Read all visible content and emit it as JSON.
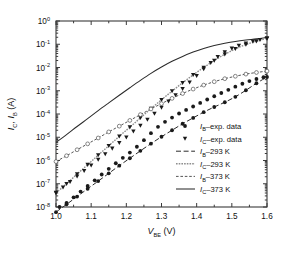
{
  "chart_data": {
    "type": "line",
    "title": "",
    "xlabel": "V_BE (V)",
    "xlabel_main": "V",
    "xlabel_sub": "BE",
    "xlabel_unit": " (V)",
    "ylabel": "I_C, I_B (A)",
    "ylabel_parts": [
      "I",
      "C",
      ", I",
      "B",
      " (A)"
    ],
    "xlim": [
      1.0,
      1.6
    ],
    "ylim_log": [
      -8,
      0
    ],
    "xticks": [
      "1.0",
      "1.1",
      "1.2",
      "1.3",
      "1.4",
      "1.5",
      "1.6"
    ],
    "xtick_values": [
      1.0,
      1.1,
      1.2,
      1.3,
      1.4,
      1.5,
      1.6
    ],
    "yticks": [
      "10^0",
      "10^-1",
      "10^-2",
      "10^-3",
      "10^-4",
      "10^-5",
      "10^-6",
      "10^-7",
      "10^-8"
    ],
    "ytick_exponents": [
      "0",
      "-1",
      "-2",
      "-3",
      "-4",
      "-5",
      "-6",
      "-7",
      "-8"
    ],
    "ytick_values": [
      1,
      0.1,
      0.01,
      0.001,
      0.0001,
      1e-05,
      1e-06,
      1e-07,
      1e-08
    ],
    "grid": false,
    "legend_position": "lower-right-inside",
    "series": [
      {
        "name": "I_C-373 K",
        "label_main": "I",
        "label_sub": "C",
        "label_rest": "–373 K",
        "style": "solid",
        "color": "#2b2b2b",
        "marker": "none",
        "x": [
          1.0,
          1.03,
          1.06,
          1.09,
          1.12,
          1.15,
          1.18,
          1.21,
          1.24,
          1.27,
          1.3,
          1.33,
          1.36,
          1.39,
          1.42,
          1.45,
          1.48,
          1.51,
          1.54,
          1.57,
          1.6
        ],
        "y": [
          6e-06,
          1.3e-05,
          2.9e-05,
          6.3e-05,
          0.00014,
          0.0003,
          0.00064,
          0.00135,
          0.0028,
          0.0056,
          0.0105,
          0.0185,
          0.03,
          0.046,
          0.066,
          0.088,
          0.11,
          0.132,
          0.152,
          0.17,
          0.195
        ]
      },
      {
        "name": "I_C-293 K",
        "label_main": "I",
        "label_sub": "C",
        "label_rest": "–293 K",
        "style": "dotted-gray",
        "color": "#8e8e8e",
        "marker": "triangle-down",
        "x": [
          1.0,
          1.03,
          1.06,
          1.09,
          1.12,
          1.15,
          1.18,
          1.21,
          1.24,
          1.27,
          1.3,
          1.33,
          1.36,
          1.39,
          1.42,
          1.45,
          1.48,
          1.51,
          1.54,
          1.57,
          1.6
        ],
        "y": [
          4e-08,
          1e-07,
          2.6e-07,
          6.6e-07,
          1.7e-06,
          4.3e-06,
          1.1e-05,
          2.7e-05,
          6.8e-05,
          0.00017,
          0.00041,
          0.00096,
          0.0022,
          0.0048,
          0.01,
          0.02,
          0.037,
          0.063,
          0.097,
          0.135,
          0.18
        ]
      },
      {
        "name": "I_B-373 K",
        "label_main": "I",
        "label_sub": "B",
        "label_rest": "–373 K",
        "style": "fine-dashed",
        "color": "#555555",
        "marker": "circle-open",
        "x": [
          1.0,
          1.03,
          1.06,
          1.09,
          1.12,
          1.15,
          1.18,
          1.21,
          1.24,
          1.27,
          1.3,
          1.33,
          1.36,
          1.39,
          1.42,
          1.45,
          1.48,
          1.51,
          1.54,
          1.57,
          1.6
        ],
        "y": [
          9e-07,
          1.6e-06,
          2.9e-06,
          5.2e-06,
          9.3e-06,
          1.7e-05,
          3e-05,
          5.3e-05,
          9.4e-05,
          0.000165,
          0.00028,
          0.00047,
          0.00076,
          0.00118,
          0.00175,
          0.00245,
          0.0033,
          0.0042,
          0.0052,
          0.0061,
          0.007
        ]
      },
      {
        "name": "I_B-293 K",
        "label_main": "I",
        "label_sub": "B",
        "label_rest": "–293 K",
        "style": "dashed",
        "color": "#2b2b2b",
        "marker": "circle-filled",
        "x": [
          1.0,
          1.03,
          1.06,
          1.09,
          1.12,
          1.15,
          1.18,
          1.21,
          1.24,
          1.27,
          1.3,
          1.33,
          1.36,
          1.39,
          1.42,
          1.45,
          1.48,
          1.51,
          1.54,
          1.57,
          1.6
        ],
        "y": [
          6e-09,
          1.3e-08,
          2.8e-08,
          6.1e-08,
          1.3e-07,
          2.8e-07,
          6e-07,
          1.25e-06,
          2.6e-06,
          5.3e-06,
          1.05e-05,
          2e-05,
          3.8e-05,
          6.8e-05,
          0.00012,
          0.0002,
          0.00032,
          0.00055,
          0.00105,
          0.0021,
          0.0039
        ]
      }
    ],
    "scatter": [
      {
        "name": "I_B-exp. data",
        "marker": "circle-filled",
        "x": [
          1.01,
          1.03,
          1.05,
          1.07,
          1.09,
          1.11,
          1.13,
          1.15,
          1.17,
          1.19,
          1.21,
          1.23,
          1.25,
          1.27,
          1.29,
          1.31,
          1.33,
          1.35,
          1.37,
          1.39,
          1.41,
          1.43,
          1.45,
          1.47,
          1.49,
          1.51,
          1.53,
          1.55,
          1.57,
          1.59
        ],
        "y": [
          1e-08,
          1.5e-08,
          2.6e-08,
          4.6e-08,
          8e-08,
          1.4e-07,
          2.5e-07,
          4.4e-07,
          7.6e-07,
          1.3e-06,
          2.2e-06,
          3.9e-06,
          7.5e-06,
          1.5e-05,
          2.8e-05,
          4.6e-05,
          7e-05,
          0.000105,
          0.00015,
          0.00021,
          0.0003,
          0.00042,
          0.00058,
          0.0008,
          0.0011,
          0.0015,
          0.002,
          0.0026,
          0.0032,
          0.0038
        ]
      },
      {
        "name": "I_C-exp. data",
        "marker": "triangle-down",
        "x": [
          1.0,
          1.02,
          1.04,
          1.06,
          1.08,
          1.1,
          1.12,
          1.14,
          1.16,
          1.18,
          1.2,
          1.22,
          1.24,
          1.26,
          1.28,
          1.3,
          1.32,
          1.34,
          1.36,
          1.38,
          1.4,
          1.42,
          1.44,
          1.46,
          1.48,
          1.5,
          1.52,
          1.54,
          1.56,
          1.58,
          1.6
        ],
        "y": [
          4.2e-08,
          7e-08,
          1.2e-07,
          2.1e-07,
          3.6e-07,
          6.2e-07,
          1.1e-06,
          1.9e-06,
          3.3e-06,
          5.8e-06,
          1e-05,
          1.8e-05,
          3.2e-05,
          5.8e-05,
          0.000105,
          0.00019,
          0.00035,
          0.00065,
          0.0012,
          0.0023,
          0.0044,
          0.0085,
          0.016,
          0.029,
          0.046,
          0.066,
          0.088,
          0.11,
          0.132,
          0.155,
          0.178
        ]
      }
    ],
    "legend": [
      {
        "id": "ib-exp",
        "marker": "circle-filled",
        "line": "none",
        "label_main": "I",
        "label_sub": "B",
        "label_rest": "–exp. data"
      },
      {
        "id": "ic-exp",
        "marker": "triangle-down",
        "line": "none",
        "label_main": "I",
        "label_sub": "C",
        "label_rest": "–exp. data"
      },
      {
        "id": "ib-293",
        "marker": "none",
        "line": "dashed",
        "label_main": "I",
        "label_sub": "B",
        "label_rest": "–293 K"
      },
      {
        "id": "ic-293",
        "marker": "none",
        "line": "dotted-gray",
        "label_main": "I",
        "label_sub": "C",
        "label_rest": "–293 K"
      },
      {
        "id": "ib-373",
        "marker": "none",
        "line": "fine-dashed",
        "label_main": "I",
        "label_sub": "B",
        "label_rest": "–373 K"
      },
      {
        "id": "ic-373",
        "marker": "none",
        "line": "solid",
        "label_main": "I",
        "label_sub": "C",
        "label_rest": "–373 K"
      }
    ]
  },
  "colors": {
    "axis": "#3a3a3a",
    "text": "#111111",
    "background": "#ffffff",
    "gray_series": "#8e8e8e",
    "dark_series": "#2b2b2b"
  }
}
